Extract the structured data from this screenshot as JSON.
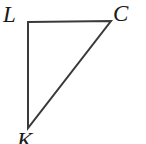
{
  "figure": {
    "type": "right-triangle",
    "background_color": "#ffffff",
    "stroke_color": "#3a3a3a",
    "stroke_width": 2,
    "vertices": [
      {
        "id": "L",
        "label": "L",
        "x": 28,
        "y": 22,
        "label_position": "top-left"
      },
      {
        "id": "C",
        "label": "C",
        "x": 111,
        "y": 21,
        "label_position": "top-right"
      },
      {
        "id": "K",
        "label": "K",
        "x": 28,
        "y": 128,
        "label_position": "bottom-left-clipped"
      }
    ],
    "edges": [
      {
        "id": "LC",
        "from": "L",
        "to": "C",
        "orientation": "horizontal"
      },
      {
        "id": "LK",
        "from": "L",
        "to": "K",
        "orientation": "vertical"
      },
      {
        "id": "KC",
        "from": "K",
        "to": "C",
        "orientation": "hypotenuse"
      }
    ],
    "right_angle_at": "L",
    "path": "M 28 22 L 111 21 L 28 128 Z"
  }
}
